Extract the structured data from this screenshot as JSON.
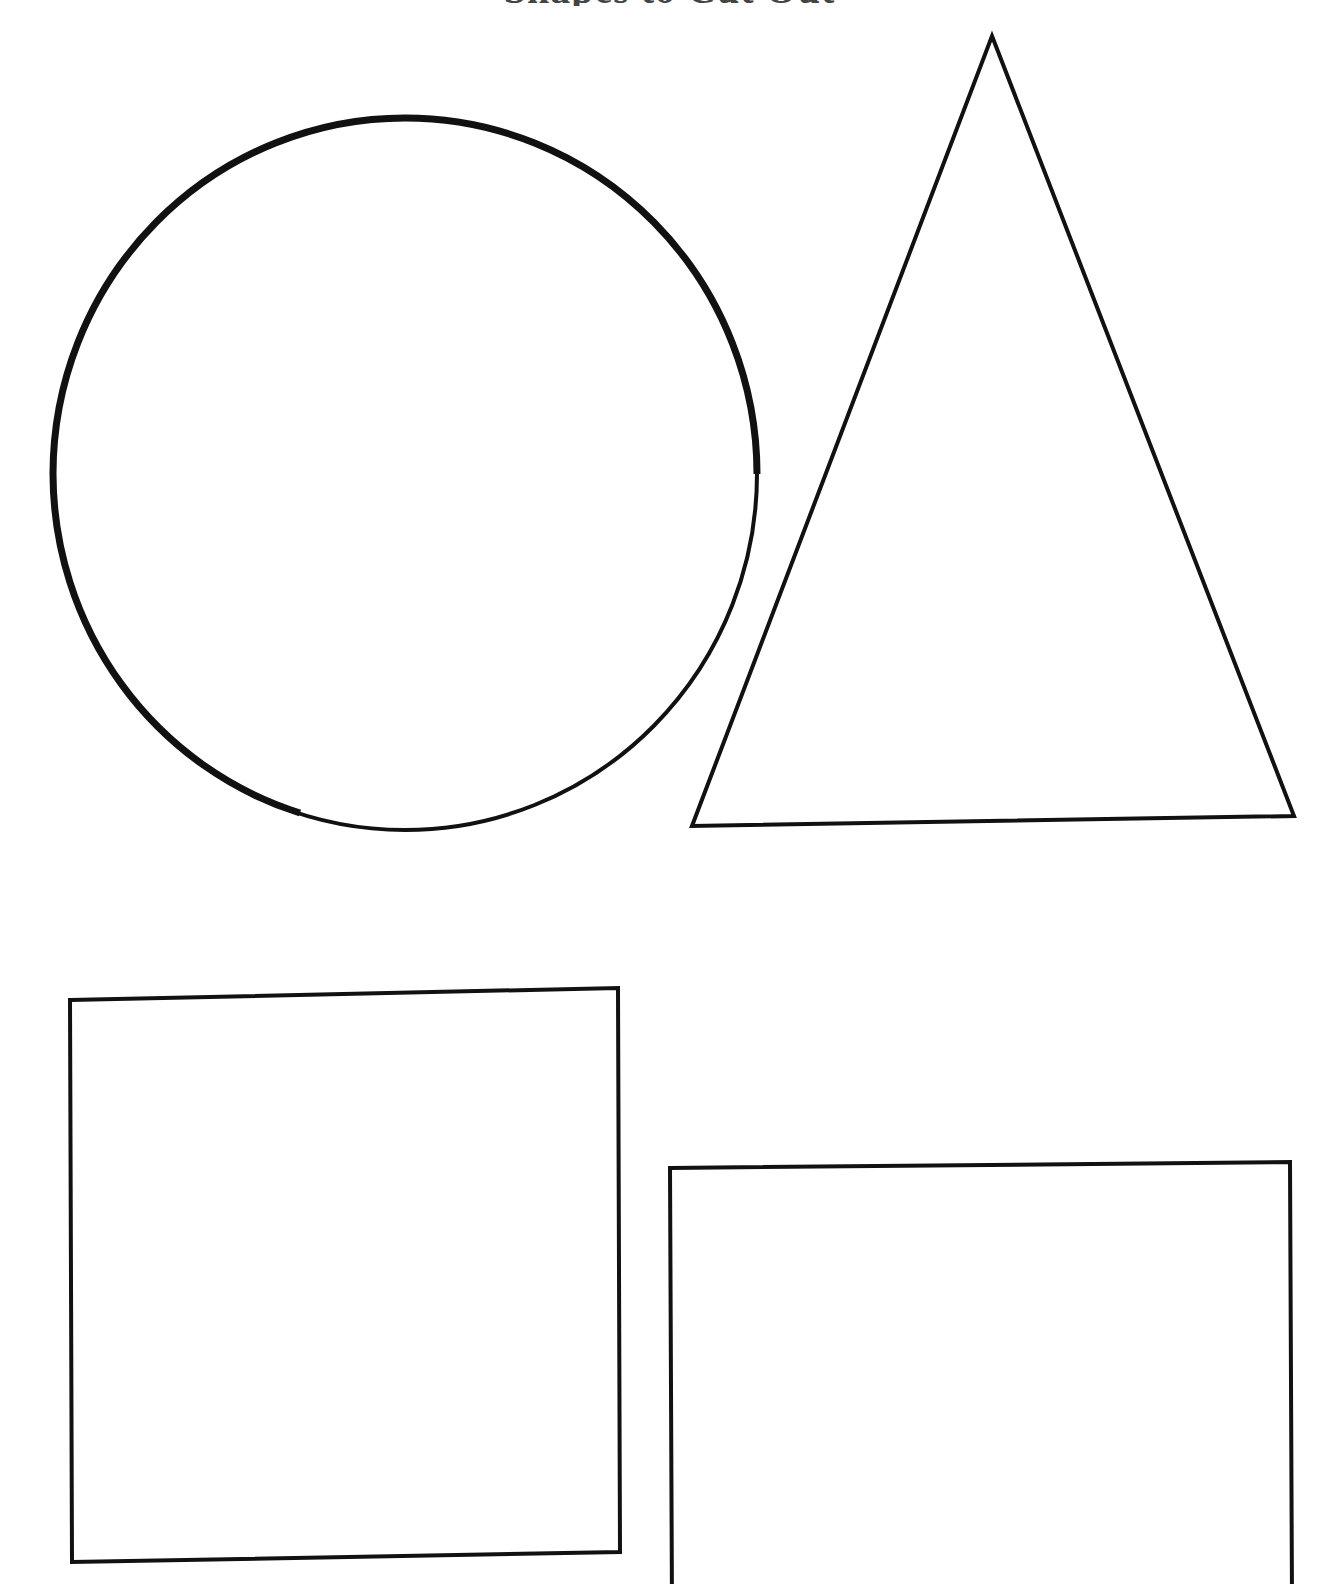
{
  "document": {
    "kind": "shapes-worksheet",
    "title_remnant": "Shapes to Cut Out",
    "background_color": "#ffffff",
    "ink_color": "#111111",
    "page_width": 1339,
    "page_height": 1584
  },
  "shapes": [
    {
      "id": "circle",
      "name": "circle",
      "label": "Circle",
      "stroke_color": "#111111",
      "stroke_width_max": 7,
      "stroke_width_min": 3,
      "center_x": 405,
      "center_y": 474,
      "radius_x": 355,
      "radius_y": 359,
      "bounds": {
        "left": 50,
        "top": 115,
        "right": 760,
        "bottom": 833
      }
    },
    {
      "id": "triangle",
      "name": "triangle",
      "label": "Triangle",
      "stroke_color": "#111111",
      "stroke_width": 4,
      "points": "992,36 1294,816 692,826",
      "bounds": {
        "left": 692,
        "top": 36,
        "right": 1294,
        "bottom": 826
      }
    },
    {
      "id": "square-left",
      "name": "square-left",
      "label": "Square",
      "stroke_color": "#111111",
      "stroke_width": 4,
      "points": "70,1000 618,988 620,1552 72,1562",
      "bounds": {
        "left": 70,
        "top": 988,
        "right": 620,
        "bottom": 1562
      }
    },
    {
      "id": "square-right",
      "name": "square-right",
      "label": "Square",
      "stroke_color": "#111111",
      "stroke_width": 4,
      "clipped_at_page_bottom": true,
      "points": "670,1168 1290,1162 1292,1600 672,1608",
      "bounds": {
        "left": 670,
        "top": 1162,
        "right": 1292,
        "bottom": 1584
      }
    }
  ]
}
